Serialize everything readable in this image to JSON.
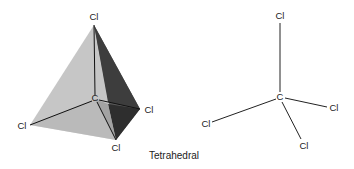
{
  "caption": "Tetrahedral",
  "colors": {
    "face_left": "#c4c4c4",
    "face_bottom": "#aeaeae",
    "face_right_dark": "#3a3a3a",
    "face_right_mid": "#6e6e6e",
    "bond": "#1a1a1a",
    "background": "#ffffff"
  },
  "model_3d": {
    "central_atom": "C",
    "ligands": [
      {
        "label": "Cl",
        "position": "top"
      },
      {
        "label": "Cl",
        "position": "left"
      },
      {
        "label": "Cl",
        "position": "right"
      },
      {
        "label": "Cl",
        "position": "bottom"
      }
    ]
  },
  "model_2d": {
    "central_atom": "C",
    "ligands": [
      {
        "label": "Cl",
        "position": "top"
      },
      {
        "label": "Cl",
        "position": "left"
      },
      {
        "label": "Cl",
        "position": "right"
      },
      {
        "label": "Cl",
        "position": "bottom"
      }
    ]
  }
}
